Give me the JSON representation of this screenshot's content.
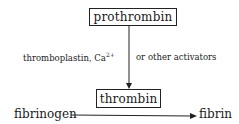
{
  "diagram": {
    "nodes": {
      "prothrombin": "prothrombin",
      "thrombin": "thrombin",
      "fibrinogen": "fibrinogen",
      "fibrin": "fibrin"
    },
    "activation_label": {
      "left": "thromboplastin, Ca",
      "superscript": "2+",
      "right": "or other activators"
    },
    "edges": [
      {
        "from": "prothrombin",
        "to": "thrombin",
        "label": "thromboplastin, Ca2+ or other activators"
      },
      {
        "from": "fibrinogen",
        "to": "fibrin",
        "catalyst": "thrombin"
      }
    ]
  }
}
